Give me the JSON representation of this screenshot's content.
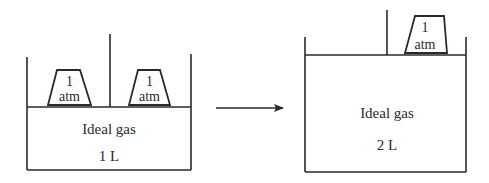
{
  "diagram": {
    "left_state": {
      "gas_label": "Ideal gas",
      "volume_label": "1 L",
      "weights": [
        {
          "line1": "1",
          "line2": "atm"
        },
        {
          "line1": "1",
          "line2": "atm"
        }
      ]
    },
    "arrow": {
      "direction": "right"
    },
    "right_state": {
      "gas_label": "Ideal gas",
      "volume_label": "2 L",
      "weights": [
        {
          "line1": "1",
          "line2": "atm"
        }
      ]
    },
    "colors": {
      "line": "#2a2a2a",
      "background": "#ffffff"
    }
  }
}
